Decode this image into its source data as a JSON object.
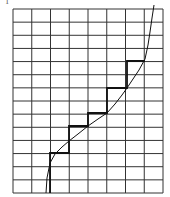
{
  "figure": {
    "label": "1",
    "grid": {
      "columns": 8,
      "rows": 14,
      "x0": 13,
      "x1": 163,
      "y0": 9,
      "y1": 193,
      "line_color": "#333333"
    },
    "staircase": {
      "color": "#111111",
      "points": [
        [
          50,
          193
        ],
        [
          50,
          153
        ],
        [
          69,
          153
        ],
        [
          69,
          126
        ],
        [
          88,
          126
        ],
        [
          88,
          113
        ],
        [
          107,
          113
        ],
        [
          107,
          88
        ],
        [
          127,
          88
        ],
        [
          127,
          61
        ],
        [
          145,
          61
        ]
      ]
    },
    "curve": {
      "color": "#111111",
      "points": [
        [
          46,
          193
        ],
        [
          47,
          178
        ],
        [
          50,
          163
        ],
        [
          55,
          154
        ],
        [
          62,
          147
        ],
        [
          69,
          141
        ],
        [
          78,
          134
        ],
        [
          88,
          126
        ],
        [
          98,
          119
        ],
        [
          107,
          113
        ],
        [
          115,
          104
        ],
        [
          122,
          95
        ],
        [
          127,
          88
        ],
        [
          133,
          79
        ],
        [
          139,
          70
        ],
        [
          145,
          59
        ],
        [
          148,
          45
        ],
        [
          150,
          32
        ],
        [
          152,
          18
        ],
        [
          154,
          5
        ]
      ]
    }
  }
}
